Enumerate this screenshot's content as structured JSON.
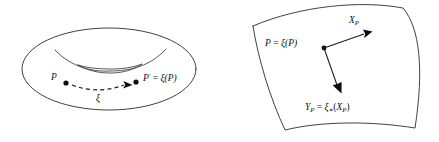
{
  "figure": {
    "caption": "",
    "background_color": "#ffffff",
    "ink_color": "#1a1a1a",
    "panels": [
      {
        "id": "torus-panel",
        "name": "torus-diagram",
        "shape": "torus",
        "labels": {
          "point_p": "P",
          "point_p_prime": "P′ = ξ(P)",
          "map_label": "ξ"
        },
        "point_p_parts": {
          "base": "P"
        },
        "point_p_prime_parts": {
          "base": "P",
          "prime": "′",
          "equals": " = ",
          "map": "ξ",
          "arg": "(P)"
        },
        "flow_arrow": "dashed-arrow"
      },
      {
        "id": "surface-patch-panel",
        "name": "surface-patch-diagram",
        "shape": "curved-surface-patch",
        "labels": {
          "point_label": "P = ξ(P)",
          "vector_x": "X",
          "vector_x_sub": "P",
          "vector_y": "Y",
          "vector_y_sub": "P",
          "pushforward": "Yₚ = ξ∗(Xₚ)"
        },
        "point_label_parts": {
          "base": "P",
          "equals": " = ",
          "map": "ξ",
          "arg": "(P)"
        },
        "vector_x_parts": {
          "base": "X",
          "sub": "P"
        },
        "vector_y_parts": {
          "base": "Y",
          "sub": "P",
          "equals": " = ",
          "map": "ξ",
          "star": "∗",
          "open": "(",
          "arg_base": "X",
          "arg_sub": "P",
          "close": ")"
        }
      }
    ]
  }
}
